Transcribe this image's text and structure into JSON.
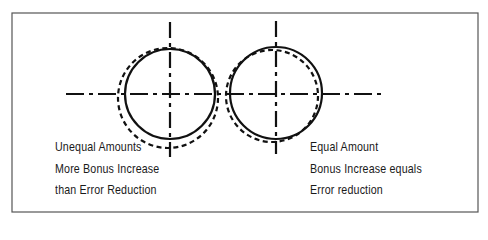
{
  "figure": {
    "frame": {
      "x": 12,
      "y": 13,
      "width": 466,
      "height": 199,
      "stroke": "#555555"
    },
    "center_line": {
      "x1": 66,
      "x2": 384,
      "y": 94
    },
    "colors": {
      "ink": "#111111",
      "frame": "#555555",
      "background": "#ffffff"
    },
    "left_example": {
      "title": "Unequal Amounts",
      "lines": [
        "Unequal Amounts",
        "More Bonus Increase",
        "than Error Reduction"
      ],
      "solid_circle": {
        "cx": 170,
        "cy": 94,
        "r": 45
      },
      "dashed_circle": {
        "cx": 168,
        "cy": 98,
        "r": 50
      },
      "vertical_axis": {
        "x": 170,
        "y1": 22,
        "y2": 157
      }
    },
    "right_example": {
      "title": "Equal Amount",
      "lines": [
        "Equal Amount",
        "Bonus Increase equals",
        "Error reduction"
      ],
      "solid_circle": {
        "cx": 276,
        "cy": 93,
        "r": 46
      },
      "dashed_circle": {
        "cx": 272,
        "cy": 96,
        "r": 46
      },
      "vertical_axis": {
        "x": 276,
        "y1": 21,
        "y2": 154
      }
    }
  }
}
